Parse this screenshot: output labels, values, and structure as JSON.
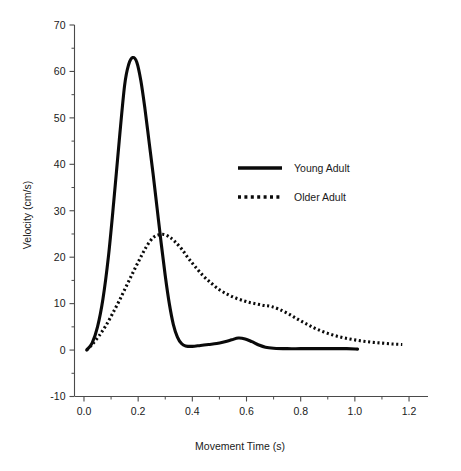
{
  "chart_data": {
    "type": "line",
    "title": "",
    "xlabel": "Movement Time (s)",
    "ylabel": "Velocity (cm/s)",
    "xlim": [
      -0.035,
      1.27
    ],
    "ylim": [
      -10,
      70
    ],
    "grid": false,
    "legend_position": "upper-center-right",
    "x_ticks_major": [
      "0.0",
      "0.2",
      "0.4",
      "0.6",
      "0.8",
      "1.0",
      "1.2"
    ],
    "x_tick_values": [
      0.0,
      0.2,
      0.4,
      0.6,
      0.8,
      1.0,
      1.2
    ],
    "x_minor_step": 0.1,
    "y_ticks_major": [
      "70",
      "60",
      "50",
      "40",
      "30",
      "20",
      "10",
      "0",
      "-10"
    ],
    "y_tick_values": [
      70,
      60,
      50,
      40,
      30,
      20,
      10,
      0,
      -10
    ],
    "y_minor_step": 5,
    "series": [
      {
        "name": "Young Adult",
        "style": "solid",
        "color": "#0a0a0a",
        "x": [
          0.01,
          0.03,
          0.05,
          0.07,
          0.09,
          0.11,
          0.13,
          0.15,
          0.165,
          0.18,
          0.195,
          0.21,
          0.225,
          0.24,
          0.255,
          0.27,
          0.285,
          0.3,
          0.315,
          0.33,
          0.345,
          0.36,
          0.375,
          0.4,
          0.43,
          0.46,
          0.49,
          0.52,
          0.545,
          0.57,
          0.595,
          0.62,
          0.645,
          0.67,
          0.7,
          0.75,
          0.8,
          0.86,
          0.92,
          0.97,
          1.01
        ],
        "y": [
          0.0,
          1.5,
          5.0,
          11.0,
          20.0,
          32.0,
          45.0,
          57.0,
          61.5,
          63.0,
          62.0,
          58.0,
          52.0,
          45.0,
          38.0,
          30.5,
          23.0,
          16.0,
          10.0,
          5.5,
          2.8,
          1.4,
          0.9,
          0.8,
          1.0,
          1.2,
          1.4,
          1.8,
          2.2,
          2.6,
          2.4,
          1.8,
          1.1,
          0.6,
          0.4,
          0.3,
          0.3,
          0.3,
          0.3,
          0.3,
          0.2
        ]
      },
      {
        "name": "Older Adult",
        "style": "dotted",
        "color": "#0a0a0a",
        "x": [
          0.01,
          0.03,
          0.055,
          0.08,
          0.105,
          0.13,
          0.155,
          0.18,
          0.205,
          0.23,
          0.255,
          0.275,
          0.295,
          0.315,
          0.335,
          0.36,
          0.385,
          0.41,
          0.44,
          0.47,
          0.5,
          0.53,
          0.56,
          0.59,
          0.615,
          0.64,
          0.665,
          0.69,
          0.72,
          0.755,
          0.79,
          0.825,
          0.86,
          0.9,
          0.94,
          0.98,
          1.02,
          1.06,
          1.1,
          1.14,
          1.175
        ],
        "y": [
          0.0,
          1.2,
          3.0,
          5.2,
          7.8,
          10.6,
          13.6,
          16.6,
          19.5,
          22.2,
          24.2,
          24.8,
          24.9,
          24.4,
          23.4,
          21.8,
          19.8,
          18.0,
          16.0,
          14.4,
          13.0,
          12.0,
          11.2,
          10.6,
          10.2,
          9.9,
          9.6,
          9.4,
          8.8,
          7.8,
          6.6,
          5.5,
          4.5,
          3.6,
          2.9,
          2.4,
          2.0,
          1.7,
          1.5,
          1.3,
          1.2
        ]
      }
    ],
    "annotations": {
      "young_peak_value": 63,
      "young_peak_time": 0.18,
      "older_peak_value": 25,
      "older_peak_time": 0.29,
      "young_secondary_peak_value": 2.6,
      "young_secondary_peak_time": 0.57
    }
  },
  "legend": {
    "entries": [
      {
        "label": "Young Adult",
        "style": "solid"
      },
      {
        "label": "Older Adult",
        "style": "dotted"
      }
    ]
  }
}
